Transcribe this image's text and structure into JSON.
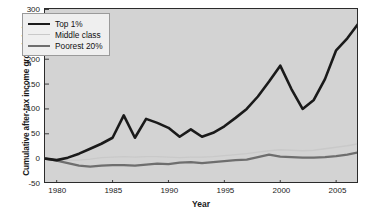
{
  "chart_data": {
    "type": "line",
    "title": "",
    "xlabel": "Year",
    "ylabel": "Cumulative after-tax income growth (%)",
    "xlim": [
      1979,
      2007
    ],
    "ylim": [
      -50,
      300
    ],
    "xticks": [
      1980,
      1985,
      1990,
      1995,
      2000,
      2005
    ],
    "yticks": [
      -50,
      0,
      50,
      100,
      150,
      200,
      250,
      300
    ],
    "grid": false,
    "legend_position": "upper-left",
    "x": [
      1979,
      1980,
      1981,
      1982,
      1983,
      1984,
      1985,
      1986,
      1987,
      1988,
      1989,
      1990,
      1991,
      1992,
      1993,
      1994,
      1995,
      1996,
      1997,
      1998,
      1999,
      2000,
      2001,
      2002,
      2003,
      2004,
      2005,
      2006,
      2007
    ],
    "series": [
      {
        "name": "Top 1%",
        "color": "#1a1a1a",
        "width": 2.6,
        "values": [
          0,
          -3,
          2,
          10,
          20,
          30,
          42,
          87,
          42,
          80,
          72,
          62,
          44,
          59,
          44,
          52,
          65,
          82,
          100,
          125,
          155,
          187,
          140,
          100,
          118,
          160,
          218,
          242,
          272
        ]
      },
      {
        "name": "Middle class",
        "color": "#c9c9c9",
        "width": 1.4,
        "values": [
          0,
          -2,
          -3,
          -3,
          -1,
          2,
          3,
          4,
          3,
          4,
          4,
          3,
          2,
          3,
          3,
          4,
          6,
          8,
          10,
          13,
          16,
          18,
          17,
          16,
          17,
          20,
          23,
          26,
          30
        ]
      },
      {
        "name": "Poorest 20%",
        "color": "#6e6e6e",
        "width": 2.2,
        "values": [
          0,
          -4,
          -9,
          -14,
          -16,
          -14,
          -13,
          -13,
          -14,
          -12,
          -10,
          -11,
          -8,
          -7,
          -9,
          -7,
          -5,
          -3,
          -2,
          3,
          8,
          4,
          3,
          2,
          2,
          3,
          5,
          8,
          13
        ]
      }
    ]
  },
  "legend": {
    "items": [
      {
        "label": "Top 1%"
      },
      {
        "label": "Middle class"
      },
      {
        "label": "Poorest 20%"
      }
    ]
  },
  "axes": {
    "x_label": "Year",
    "y_label": "Cumulative after-tax income growth (%)",
    "x_tick_labels": [
      "1980",
      "1985",
      "1990",
      "1995",
      "2000",
      "2005"
    ],
    "y_tick_labels": [
      "300",
      "250",
      "200",
      "150",
      "100",
      "50",
      "0",
      "-50"
    ]
  },
  "colors": {
    "plot_background": "#d3d3d3",
    "figure_background": "#ffffff",
    "axis": "#2b2b2b",
    "top1": "#1a1a1a",
    "middle": "#c9c9c9",
    "poorest": "#6e6e6e"
  }
}
